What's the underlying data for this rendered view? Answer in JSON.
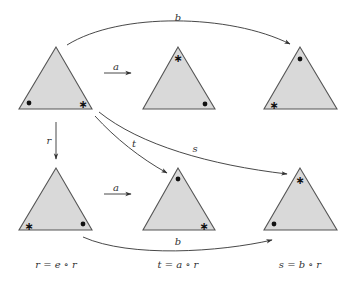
{
  "diagram": {
    "type": "group-action-commutative-diagram",
    "triangles": [
      {
        "id": "top-left",
        "position": "row1-col1",
        "markers": {
          "bottom-left": "dot",
          "bottom-right": "star"
        }
      },
      {
        "id": "top-middle",
        "position": "row1-col2",
        "markers": {
          "top": "star",
          "bottom-right": "dot"
        }
      },
      {
        "id": "top-right",
        "position": "row1-col3",
        "markers": {
          "top": "dot",
          "bottom-left": "star"
        }
      },
      {
        "id": "bottom-left",
        "position": "row2-col1",
        "markers": {
          "bottom-left": "star",
          "bottom-right": "dot"
        }
      },
      {
        "id": "bottom-middle",
        "position": "row2-col2",
        "markers": {
          "top": "dot",
          "bottom-right": "star"
        }
      },
      {
        "id": "bottom-right",
        "position": "row2-col3",
        "markers": {
          "top": "star",
          "bottom-left": "dot"
        }
      }
    ],
    "edges": {
      "top_a": {
        "label": "a",
        "from": "top-left",
        "to": "top-middle"
      },
      "top_b": {
        "label": "b",
        "from": "top-left",
        "to": "top-right"
      },
      "r": {
        "label": "r",
        "from": "top-left",
        "to": "bottom-left"
      },
      "t": {
        "label": "t",
        "from": "top-left",
        "to": "bottom-middle"
      },
      "s": {
        "label": "s",
        "from": "top-left",
        "to": "bottom-right"
      },
      "bottom_a": {
        "label": "a",
        "from": "bottom-left",
        "to": "bottom-middle"
      },
      "bottom_b": {
        "label": "b",
        "from": "bottom-left",
        "to": "bottom-right"
      }
    },
    "captions": {
      "left": "r = e ∘ r",
      "middle": "t = a ∘ r",
      "right": "s = b ∘ r"
    },
    "marker_glyphs": {
      "star": "∗",
      "dot": "●"
    },
    "colors": {
      "triangle_fill": "#d9d9d9",
      "triangle_stroke": "#555555",
      "arrow": "#333333",
      "marker": "#111111"
    }
  }
}
